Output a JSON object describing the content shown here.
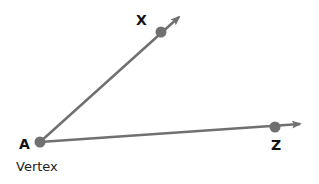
{
  "diagram": {
    "color": "#707070",
    "points": [
      {
        "id": "A",
        "label": "A",
        "x": 40,
        "y": 142,
        "role": "vertex"
      },
      {
        "id": "X",
        "label": "X",
        "x": 161,
        "y": 32
      },
      {
        "id": "Z",
        "label": "Z",
        "x": 275,
        "y": 127
      }
    ],
    "rays": [
      {
        "from": "A",
        "through": "X",
        "tip": [
          181,
          15
        ]
      },
      {
        "from": "A",
        "through": "Z",
        "tip": [
          302,
          124
        ]
      }
    ],
    "labels": {
      "A": "A",
      "X": "X",
      "Z": "Z",
      "vertex_caption": "Vertex"
    }
  }
}
